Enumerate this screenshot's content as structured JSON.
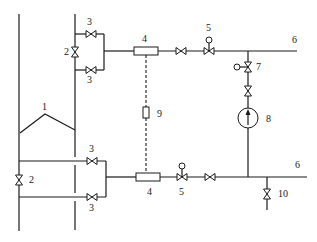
{
  "diagram": {
    "type": "piping-schematic",
    "labels": {
      "vessel": "1",
      "root_valve_left": "2",
      "root_valve_upper": "2",
      "isolation_valve_upper_top": "3",
      "isolation_valve_upper_bottom": "3",
      "isolation_valve_lower_top": "3",
      "isolation_valve_lower_bottom": "3",
      "condenser_upper": "4",
      "condenser_lower": "4",
      "valve_upper": "5",
      "valve_lower": "5",
      "outlet_upper": "6",
      "outlet_lower": "6",
      "balance_valve": "7",
      "gauge": "8",
      "connector": "9",
      "drain_valve": "10"
    },
    "colors": {
      "line": "#1a1a1a",
      "background": "#ffffff"
    }
  }
}
